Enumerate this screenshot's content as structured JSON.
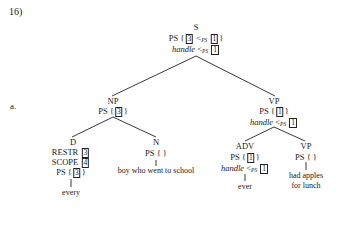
{
  "example_number": "16)",
  "sub_label": "a.",
  "nodes": {
    "S": {
      "cat": "S",
      "ps_pre": "PS {",
      "ps_a": "3",
      "lt": "<",
      "rs": "PS",
      "ps_b": "1",
      "ps_post": "}",
      "handle": "handle",
      "handle_lt": "<",
      "handle_rs": "PS",
      "handle_num": "1"
    },
    "NP": {
      "cat": "NP",
      "ps_pre": "PS {",
      "ps_a": "3",
      "ps_post": "}"
    },
    "VP": {
      "cat": "VP",
      "ps_pre": "PS {",
      "ps_a": "1",
      "ps_post": "}",
      "handle": "handle",
      "handle_lt": "<",
      "handle_rs": "PS",
      "handle_num": "1"
    },
    "D": {
      "cat": "D",
      "restr": "RESTR",
      "restr_num": "3",
      "scope": "SCOPE",
      "scope_num": "4",
      "ps_pre": "PS {",
      "ps_a": "3",
      "ps_post": "}",
      "word": "every"
    },
    "N": {
      "cat": "N",
      "ps": "PS { }",
      "word": "boy who went to school"
    },
    "ADV": {
      "cat": "ADV",
      "ps_pre": "PS {",
      "ps_a": "1",
      "ps_post": "}",
      "handle": "handle",
      "handle_lt": "<",
      "handle_rs": "PS",
      "handle_num": "1",
      "word": "ever"
    },
    "VP2": {
      "cat": "VP",
      "ps": "PS { }",
      "word_line1": "had apples",
      "word_line2": "for lunch"
    }
  }
}
